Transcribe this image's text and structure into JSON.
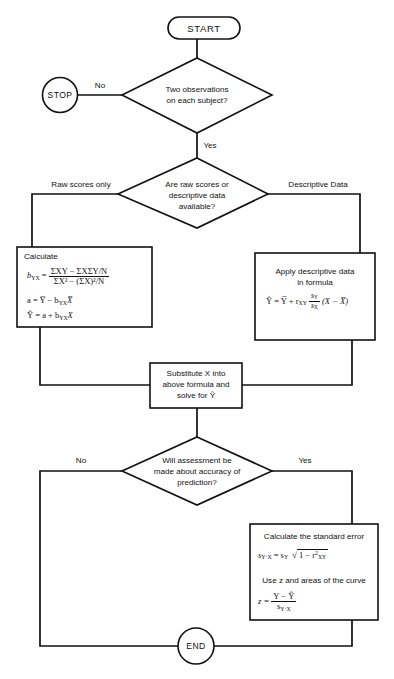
{
  "diagram": {
    "background_color": "#ffffff",
    "line_color": "#111111"
  },
  "nodes": {
    "start": {
      "label": "START",
      "shape": "terminator"
    },
    "stop": {
      "label": "STOP",
      "shape": "circle"
    },
    "decision_observations": {
      "shape": "decision",
      "line1": "Two observations",
      "line2": "on each subject?"
    },
    "decision_data_type": {
      "shape": "decision",
      "line1": "Are raw scores or",
      "line2": "descriptive data",
      "line3": "available?"
    },
    "process_calculate": {
      "shape": "process",
      "heading": "Calculate",
      "formula_b_lhs": "b",
      "formula_b_sub": "YX",
      "formula_b_eq": "=",
      "formula_b_num": "ΣXY − ΣXΣY/N",
      "formula_b_den": "ΣX² − (ΣX)²/N",
      "formula_a": "a = Y̅ − b",
      "formula_a_sub": "YX",
      "formula_a_tail": "X̅",
      "formula_yhat": "Ŷ = a + b",
      "formula_yhat_sub": "YX",
      "formula_yhat_tail": "X"
    },
    "process_descriptive": {
      "shape": "process",
      "line1": "Apply descriptive data",
      "line2": "in formula",
      "formula_lhs": "Ŷ = Y̅ + r",
      "formula_r_sub": "XY",
      "formula_frac_num": "s",
      "formula_frac_num_sub": "Y",
      "formula_frac_den": "s",
      "formula_frac_den_sub": "X",
      "formula_tail": "(X − X̅)"
    },
    "process_substitute": {
      "shape": "process",
      "line1": "Substitute X into",
      "line2": "above formula and",
      "line3": "solve for Ŷ"
    },
    "decision_assessment": {
      "shape": "decision",
      "line1": "Will assessment be",
      "line2": "made about accuracy of",
      "line3": "prediction?"
    },
    "process_standard_error": {
      "shape": "process",
      "line1": "Calculate the standard error",
      "formula_se_lhs": "s",
      "formula_se_lhs_sub": "Y·X",
      "formula_se_eq": "= s",
      "formula_se_sy_sub": "Y",
      "formula_se_radicand": "1 − r",
      "formula_se_r_sub": "XY",
      "formula_se_r_sup": "2",
      "line2": "Use z and areas of the curve",
      "formula_z_lhs": "z =",
      "formula_z_num": "Y − Ŷ",
      "formula_z_den": "s",
      "formula_z_den_sub": "Y·X"
    },
    "end": {
      "label": "END",
      "shape": "circle"
    }
  },
  "edge_labels": {
    "no_observations": "No",
    "yes_observations": "Yes",
    "raw_scores": "Raw scores only",
    "descriptive_data": "Descriptive Data",
    "no_assessment": "No",
    "yes_assessment": "Yes"
  }
}
